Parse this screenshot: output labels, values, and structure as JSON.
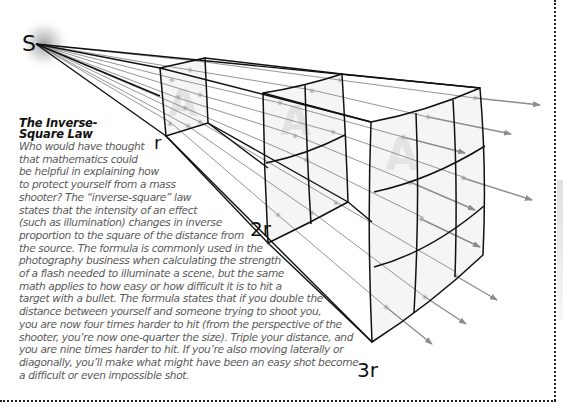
{
  "diagram": {
    "source_label": "S",
    "frames": [
      {
        "label": "r",
        "letter": "A"
      },
      {
        "label": "2r",
        "letter": "A"
      },
      {
        "label": "3r",
        "letter": "A"
      }
    ],
    "colors": {
      "line": "#111111",
      "ray": "#8a8a8a",
      "arrow": "#8c8c8c",
      "panel_fill": "#f4f4f4",
      "glow": "#9a9a9a"
    }
  },
  "caption": {
    "title_line1": "The Inverse-",
    "title_line2": "Square Law",
    "body_lines": [
      "Who would have thought",
      "that mathematics could",
      "be helpful in explaining how",
      "to protect yourself from a mass",
      "shooter? The “inverse-square” law",
      "states that the intensity of an effect",
      "(such as illumination) changes in inverse",
      "proportion to the square of the distance from",
      "the source. The formula is commonly used in the",
      "photography business when calculating the strength",
      "of a flash needed to illuminate a scene, but the same",
      "math applies to how easy or how difficult it is to hit a",
      "target with a bullet. The formula states that if you double the",
      "distance between yourself and someone trying to shoot you,",
      "you are now four times harder to hit (from the perspective of the",
      "shooter, you’re now one-quarter the size). Triple your distance, and",
      "you are nine times harder to hit. If you’re also moving laterally or",
      "diagonally, you’ll make what might have been an easy shot become",
      "a difficult or even impossible shot."
    ]
  }
}
